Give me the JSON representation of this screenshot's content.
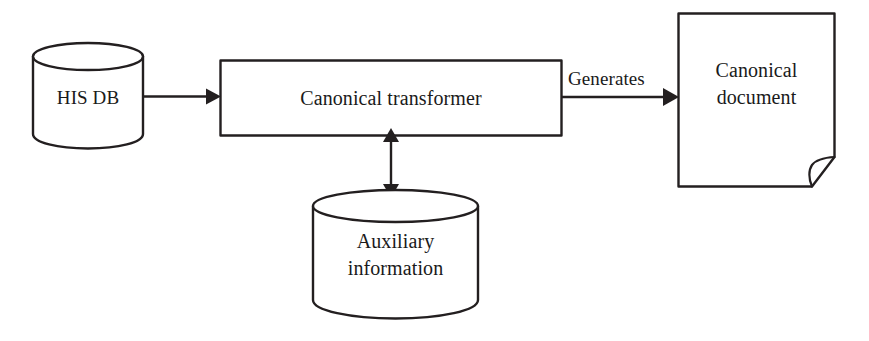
{
  "diagram": {
    "background_color": "#ffffff",
    "stroke_color": "#231f20",
    "text_color": "#1a1a1a",
    "nodes": {
      "his_db": {
        "label": "HIS DB",
        "shape": "cylinder"
      },
      "transformer": {
        "label": "Canonical transformer",
        "shape": "rectangle"
      },
      "document": {
        "label_line1": "Canonical",
        "label_line2": "document",
        "shape": "document"
      },
      "auxiliary": {
        "label_line1": "Auxiliary",
        "label_line2": "information",
        "shape": "cylinder"
      }
    },
    "edges": {
      "db_to_transformer": {
        "label": "",
        "style": "single-arrow"
      },
      "transformer_to_document": {
        "label": "Generates",
        "style": "single-arrow"
      },
      "transformer_to_auxiliary": {
        "label": "",
        "style": "double-arrow"
      }
    }
  }
}
